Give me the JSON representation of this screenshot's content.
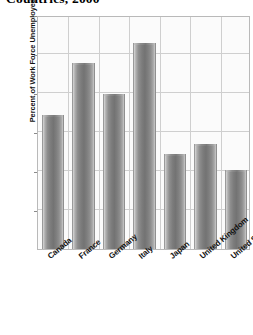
{
  "chart_data": {
    "type": "bar",
    "title": "Countries, 2000",
    "xlabel": "",
    "ylabel": "Percent of Work Force Unemployed",
    "categories": [
      "Canada",
      "France",
      "Germany",
      "Italy",
      "Japan",
      "United Kingdom",
      "United States"
    ],
    "values": [
      6.85,
      9.55,
      7.95,
      10.55,
      4.85,
      5.4,
      4.05
    ],
    "ylim": [
      0,
      12
    ],
    "yticks": [
      2,
      4,
      6,
      8,
      10,
      12
    ],
    "ytick_labels": [
      "2",
      "4",
      "6",
      "8",
      "10",
      "12"
    ],
    "grid": true,
    "legend": false,
    "bar_color": "#7c7c7c",
    "plot_background": "#fbfbfb",
    "gridline_color": "#cfcfcf",
    "axis_color": "#b9b9b9"
  },
  "caption": {
    "source_text": ""
  }
}
